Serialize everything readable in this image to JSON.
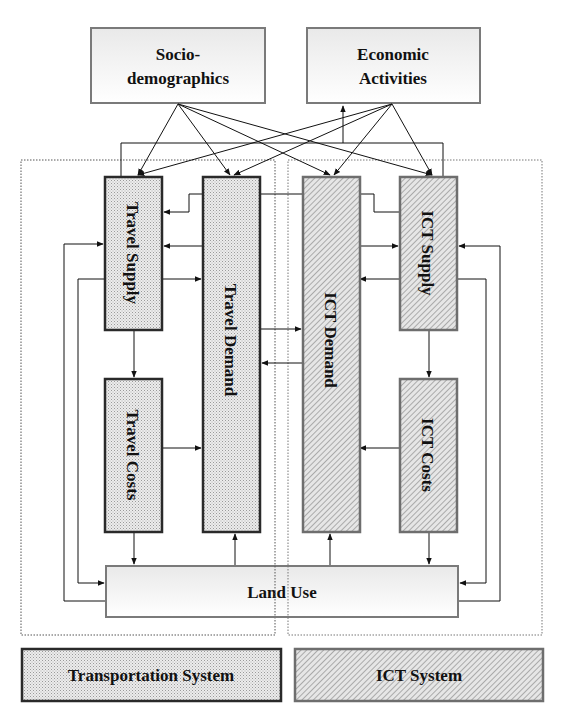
{
  "diagram": {
    "external_nodes": {
      "socio": {
        "line1": "Socio-",
        "line2": "demographics"
      },
      "economic": {
        "line1": "Economic",
        "line2": "Activities"
      }
    },
    "transport_nodes": {
      "travel_supply": "Travel Supply",
      "travel_demand": "Travel  Demand",
      "travel_costs": "Travel Costs"
    },
    "ict_nodes": {
      "ict_demand": "ICT  Demand",
      "ict_supply": "ICT  Supply",
      "ict_costs": "ICT Costs"
    },
    "land_use": "Land Use",
    "legend": {
      "transport": "Transportation System",
      "ict": "ICT System"
    },
    "colors": {
      "transport_border": "#2a2a2a",
      "ict_border": "#6e6e6e",
      "external_border": "#7a7a7a",
      "line": "#111111"
    }
  }
}
